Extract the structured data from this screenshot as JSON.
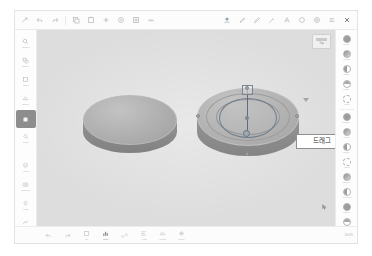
{
  "app": {
    "canvas_bg": "#dddddd",
    "accent": "#6f7e8c"
  },
  "toolbar": {
    "left_tools": [
      {
        "name": "cursor-select-tool",
        "label": ""
      },
      {
        "name": "undo-tool",
        "label": ""
      },
      {
        "name": "redo-tool",
        "label": ""
      },
      {
        "name": "copy-tool",
        "label": ""
      },
      {
        "name": "paste-tool",
        "label": ""
      },
      {
        "name": "add-tool",
        "label": ""
      },
      {
        "name": "target-tool",
        "label": ""
      },
      {
        "name": "grid-tool",
        "label": ""
      },
      {
        "name": "ruler-tool",
        "label": ""
      }
    ],
    "right_tools": [
      {
        "name": "material-tool",
        "label": ""
      },
      {
        "name": "pen-tool",
        "label": ""
      },
      {
        "name": "brush-tool",
        "label": ""
      },
      {
        "name": "eyedropper-tool",
        "label": ""
      },
      {
        "name": "text-tool",
        "label": ""
      },
      {
        "name": "circle-tool",
        "label": ""
      },
      {
        "name": "settings-tool",
        "label": ""
      },
      {
        "name": "list-tool",
        "label": ""
      },
      {
        "name": "close-tool",
        "label": ""
      }
    ]
  },
  "left_rail": {
    "items": [
      {
        "icon": "search-icon",
        "label": "Search",
        "selected": false
      },
      {
        "icon": "shapes-icon",
        "label": "Shape",
        "selected": false
      },
      {
        "icon": "cube-icon",
        "label": "Cube",
        "selected": false
      },
      {
        "icon": "group-icon",
        "label": "Group",
        "selected": false
      },
      {
        "icon": "swatch-icon",
        "label": "",
        "selected": true
      },
      {
        "icon": "paint-icon",
        "label": "Paint",
        "selected": false
      }
    ],
    "items_lower": [
      {
        "icon": "layers-icon",
        "label": "Layer",
        "selected": false
      },
      {
        "icon": "camera-icon",
        "label": "Camera",
        "selected": false
      },
      {
        "icon": "light-icon",
        "label": "Light",
        "selected": false
      },
      {
        "icon": "effect-icon",
        "label": "Effect",
        "selected": false
      }
    ],
    "swatch_color": "#8d8d8d"
  },
  "right_rail": {
    "items": [
      {
        "icon": "material-sphere-icon",
        "label": "Metal",
        "style": "full"
      },
      {
        "icon": "material-sphere-icon",
        "label": "Plastic",
        "style": "grad"
      },
      {
        "icon": "material-sphere-icon",
        "label": "Glass",
        "style": "half"
      },
      {
        "icon": "material-sphere-icon",
        "label": "Matte",
        "style": "quarter"
      },
      {
        "icon": "material-sphere-icon",
        "label": "Clear",
        "style": "dotted"
      },
      {
        "icon": "material-sphere-icon",
        "label": "Rubber",
        "style": "full"
      },
      {
        "icon": "material-sphere-icon",
        "label": "Wood",
        "style": "grad"
      },
      {
        "icon": "material-sphere-icon",
        "label": "Stone",
        "style": "half"
      },
      {
        "icon": "material-sphere-icon",
        "label": "Paint",
        "style": "dotted"
      },
      {
        "icon": "material-sphere-icon",
        "label": "Chrome",
        "style": "grad"
      },
      {
        "icon": "material-sphere-icon",
        "label": "Ceramic",
        "style": "half"
      },
      {
        "icon": "material-sphere-icon",
        "label": "Liquid",
        "style": "full"
      },
      {
        "icon": "material-sphere-icon",
        "label": "Custom",
        "style": "quarter"
      }
    ],
    "footer_label": "1/2"
  },
  "viewport": {
    "tooltip": "드래그",
    "panel": {
      "label": "Top"
    },
    "objects": [
      {
        "name": "disc-left",
        "selected": false
      },
      {
        "name": "disc-right",
        "selected": true
      }
    ]
  },
  "bottombar": {
    "items": [
      {
        "icon": "undo-icon",
        "label": "",
        "active": false
      },
      {
        "icon": "redo-icon",
        "label": "",
        "active": false
      },
      {
        "icon": "frame-icon",
        "label": "Fit",
        "active": false
      },
      {
        "icon": "chart-icon",
        "label": "Prop",
        "active": true
      },
      {
        "icon": "link-icon",
        "label": "",
        "active": false
      },
      {
        "icon": "align-icon",
        "label": "Align",
        "active": false
      },
      {
        "icon": "merge-icon",
        "label": "Merge",
        "active": false
      },
      {
        "icon": "mirror-icon",
        "label": "Mirror",
        "active": false
      }
    ],
    "status": "100%"
  }
}
